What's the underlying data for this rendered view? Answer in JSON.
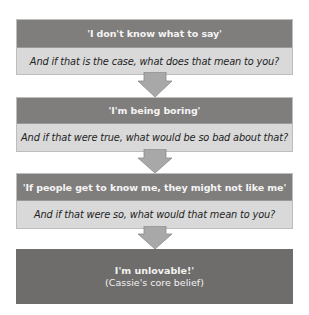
{
  "diagram": {
    "steps": [
      {
        "thought": "'I don't know what to say'",
        "question": "And if that is the case, what does that mean to you?"
      },
      {
        "thought": "'I'm being boring'",
        "question": "And if that were true, what would be so bad about that?"
      },
      {
        "thought": "'If people get to know me, they might not like me'",
        "question": "And if that were so, what would that mean to you?"
      }
    ],
    "final": {
      "belief": "I'm unlovable!'",
      "caption": "(Cassie's core belief)"
    },
    "colors": {
      "thought_band": "#7f7e7c",
      "question_band": "#d9d9d9",
      "final_box": "#6e6d6b",
      "arrow": "#a6a6a6"
    }
  }
}
